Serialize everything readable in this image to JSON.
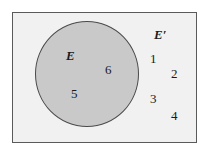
{
  "diagram": {
    "type": "venn",
    "universe_fill": "#f1f1f1",
    "set_fill": "#c9c9c9",
    "set": {
      "label": "E",
      "elements": [
        "5",
        "6"
      ]
    },
    "complement": {
      "label": "E′",
      "elements": [
        "1",
        "2",
        "3",
        "4"
      ]
    }
  }
}
